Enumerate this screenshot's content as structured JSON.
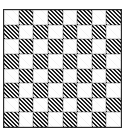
{
  "image": {
    "title": "Checkerboard pattern",
    "width": 135,
    "height": 137,
    "background_color": "#ffffff"
  },
  "board": {
    "name": "checkerboard",
    "rows": 8,
    "columns": 8,
    "origin_x": 3,
    "origin_y": 9,
    "size": 119,
    "cell_size": 14.6,
    "border_color": "#2b2b2b",
    "border_width": 1,
    "light_color": "#fdfdfd",
    "dark_color": "#1c1c1c",
    "dark_fill_style": "diagonal-hatch",
    "hatch_angle_degrees": 45,
    "hatch_direction": "bottom-left-to-top-right",
    "top_left_square": "light",
    "squares": [
      [
        "light",
        "dark",
        "light",
        "dark",
        "light",
        "dark",
        "light",
        "dark"
      ],
      [
        "dark",
        "light",
        "dark",
        "light",
        "dark",
        "light",
        "dark",
        "light"
      ],
      [
        "light",
        "dark",
        "light",
        "dark",
        "light",
        "dark",
        "light",
        "dark"
      ],
      [
        "dark",
        "light",
        "dark",
        "light",
        "dark",
        "light",
        "dark",
        "light"
      ],
      [
        "light",
        "dark",
        "light",
        "dark",
        "light",
        "dark",
        "light",
        "dark"
      ],
      [
        "dark",
        "light",
        "dark",
        "light",
        "dark",
        "light",
        "dark",
        "light"
      ],
      [
        "light",
        "dark",
        "light",
        "dark",
        "light",
        "dark",
        "light",
        "dark"
      ],
      [
        "dark",
        "light",
        "dark",
        "light",
        "dark",
        "light",
        "dark",
        "light"
      ]
    ]
  }
}
